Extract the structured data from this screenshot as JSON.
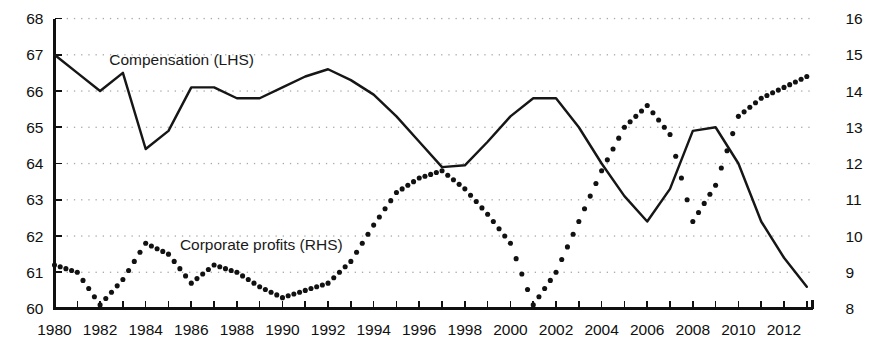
{
  "chart_data": {
    "type": "line",
    "title": "",
    "subtitle": "",
    "xlabel": "",
    "ylabel": "",
    "grid": true,
    "legend_position": "inline-annotation",
    "x": [
      1980,
      1981,
      1982,
      1983,
      1984,
      1985,
      1986,
      1987,
      1988,
      1989,
      1990,
      1991,
      1992,
      1993,
      1994,
      1995,
      1996,
      1997,
      1998,
      1999,
      2000,
      2001,
      2002,
      2003,
      2004,
      2005,
      2006,
      2007,
      2008,
      2009,
      2010,
      2011,
      2012,
      2013
    ],
    "xlim": [
      1980,
      2013.25
    ],
    "xticks": [
      1980,
      1981,
      1982,
      1983,
      1984,
      1985,
      1986,
      1987,
      1988,
      1989,
      1990,
      1991,
      1992,
      1993,
      1994,
      1995,
      1996,
      1997,
      1998,
      1999,
      2000,
      2001,
      2002,
      2003,
      2004,
      2005,
      2006,
      2007,
      2008,
      2009,
      2010,
      2011,
      2012,
      2013
    ],
    "xtick_labels": [
      "1980",
      "",
      "1982",
      "",
      "1984",
      "",
      "1986",
      "",
      "1988",
      "",
      "1990",
      "",
      "1992",
      "",
      "1994",
      "",
      "1996",
      "",
      "1998",
      "",
      "2000",
      "",
      "2002",
      "",
      "2004",
      "",
      "2006",
      "",
      "2008",
      "",
      "2010",
      "",
      "2012",
      ""
    ],
    "left_axis": {
      "ylim": [
        60,
        68
      ],
      "yticks": [
        60,
        61,
        62,
        63,
        64,
        65,
        66,
        67,
        68
      ],
      "ytick_labels": [
        "60",
        "61",
        "62",
        "63",
        "64",
        "65",
        "66",
        "67",
        "68"
      ]
    },
    "right_axis": {
      "ylim": [
        8,
        16
      ],
      "yticks": [
        8,
        9,
        10,
        11,
        12,
        13,
        14,
        15,
        16
      ],
      "ytick_labels": [
        "8",
        "9",
        "10",
        "11",
        "12",
        "13",
        "14",
        "15",
        "16"
      ]
    },
    "series": [
      {
        "name": "Compensation (LHS)",
        "axis": "left",
        "style": "solid-line",
        "color": "#161616",
        "values": [
          67.0,
          66.5,
          66.0,
          66.5,
          64.4,
          64.9,
          66.1,
          66.1,
          65.8,
          65.8,
          66.1,
          66.4,
          66.6,
          66.3,
          65.9,
          65.3,
          64.6,
          63.9,
          63.95,
          64.6,
          65.3,
          65.8,
          65.8,
          65.0,
          64.0,
          63.1,
          62.4,
          63.3,
          64.9,
          65.0,
          64.0,
          62.4,
          61.4,
          60.6
        ]
      },
      {
        "name": "Corporate profits (RHS)",
        "axis": "right",
        "style": "dotted-markers",
        "color": "#111111",
        "values": [
          9.2,
          9.0,
          8.1,
          8.8,
          9.8,
          9.5,
          8.7,
          9.2,
          9.0,
          8.6,
          8.3,
          8.5,
          8.7,
          9.3,
          10.3,
          11.2,
          11.6,
          11.8,
          11.3,
          10.6,
          9.8,
          8.1,
          9.0,
          10.4,
          11.8,
          13.0,
          13.6,
          12.8,
          10.4,
          11.4,
          13.3,
          13.8,
          14.1,
          14.4
        ]
      }
    ],
    "annotations": [
      {
        "text": "Compensation (LHS)",
        "x": 1982.4,
        "y_left": 66.85
      },
      {
        "text": "Corporate profits (RHS)",
        "x": 1985.5,
        "y_left": 61.75
      }
    ]
  }
}
